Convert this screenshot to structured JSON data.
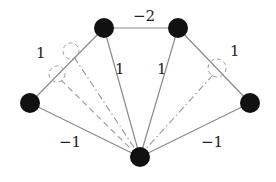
{
  "diagram": {
    "type": "weighted-graph",
    "nodes": [
      {
        "id": "top-left",
        "x": 104,
        "y": 28
      },
      {
        "id": "top-right",
        "x": 178,
        "y": 28
      },
      {
        "id": "left",
        "x": 30,
        "y": 103
      },
      {
        "id": "right",
        "x": 250,
        "y": 103
      },
      {
        "id": "bottom",
        "x": 140,
        "y": 157
      }
    ],
    "edges": [
      {
        "from": "top-left",
        "to": "top-right",
        "weight": "−2",
        "label_x": 141,
        "label_y": 20
      },
      {
        "from": "left",
        "to": "top-left",
        "weight": "1",
        "label_x": 40,
        "label_y": 57
      },
      {
        "from": "top-left",
        "to": "bottom",
        "weight": "1",
        "label_x": 118,
        "label_y": 73
      },
      {
        "from": "top-right",
        "to": "bottom",
        "weight": "1",
        "label_x": 160,
        "label_y": 73
      },
      {
        "from": "top-right",
        "to": "right",
        "weight": "1",
        "label_x": 233,
        "label_y": 54
      },
      {
        "from": "left",
        "to": "bottom",
        "weight": "−1",
        "label_x": 67,
        "label_y": 146
      },
      {
        "from": "right",
        "to": "bottom",
        "weight": "−1",
        "label_x": 210,
        "label_y": 146
      }
    ],
    "auxiliary_circles": [
      {
        "cx": 71,
        "cy": 51,
        "r": 8
      },
      {
        "cx": 57,
        "cy": 74,
        "r": 8
      },
      {
        "cx": 217,
        "cy": 68,
        "r": 9
      }
    ],
    "auxiliary_lines": [
      {
        "style": "dash-dot",
        "from": "circle-0",
        "to": "bottom"
      },
      {
        "style": "dashed",
        "from": "circle-1",
        "to": "bottom"
      },
      {
        "style": "dash-dot",
        "from": "circle-2",
        "to": "bottom"
      }
    ],
    "colors": {
      "node": "#111111",
      "edge": "#8a8a8a",
      "label": "#222222"
    }
  }
}
